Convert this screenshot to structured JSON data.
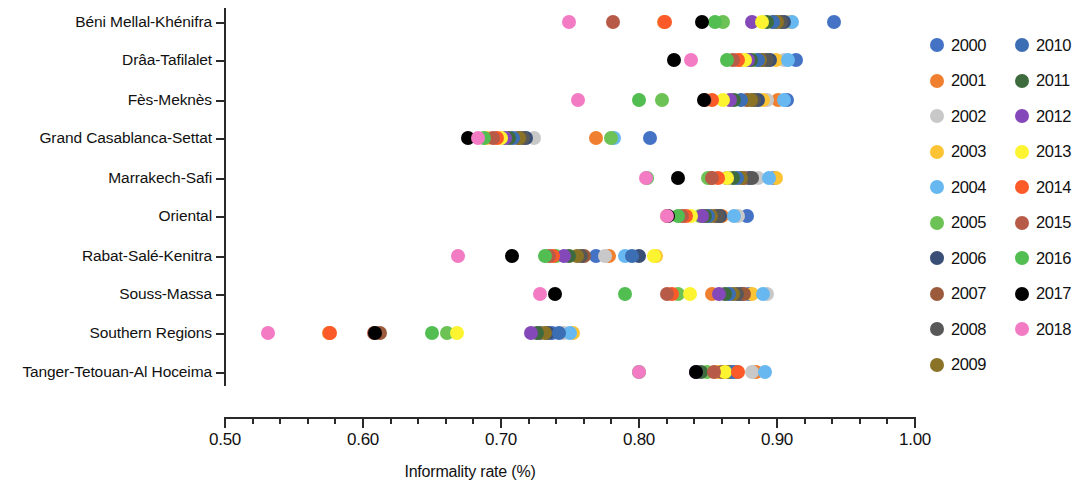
{
  "chart_data": {
    "type": "scatter",
    "title": "",
    "xlabel": "Informality rate (%)",
    "ylabel": "",
    "xlim": [
      0.5,
      1.0
    ],
    "xticks": [
      0.5,
      0.6,
      0.7,
      0.8,
      0.9,
      1.0
    ],
    "xtick_labels": [
      "0.50",
      "0.60",
      "0.70",
      "0.80",
      "0.90",
      "1.00"
    ],
    "xminor_step": 0.02,
    "grid": false,
    "legend_position": "right",
    "categories": [
      "Béni Mellal-Khénifra",
      "Drâa-Tafilalet",
      "Fès-Meknès",
      "Grand Casablanca-Settat",
      "Marrakech-Safi",
      "Oriental",
      "Rabat-Salé-Kenitra",
      "Souss-Massa",
      "Southern Regions",
      "Tanger-Tetouan-Al Hoceima"
    ],
    "series": [
      {
        "name": "2000",
        "color": "#4472c4",
        "values": [
          0.941,
          0.914,
          0.907,
          0.808,
          0.898,
          0.878,
          0.769,
          0.88,
          0.737,
          0.871
        ]
      },
      {
        "name": "2001",
        "color": "#f08030",
        "values": [
          0.818,
          0.873,
          0.901,
          0.769,
          0.852,
          0.86,
          0.778,
          0.853,
          0.575,
          0.885
        ]
      },
      {
        "name": "2002",
        "color": "#c8c8c8",
        "values": [
          0.908,
          0.905,
          0.893,
          0.724,
          0.886,
          0.872,
          0.775,
          0.893,
          0.746,
          0.882
        ]
      },
      {
        "name": "2003",
        "color": "#fcc435",
        "values": [
          0.91,
          0.899,
          0.89,
          0.69,
          0.899,
          0.82,
          0.812,
          0.882,
          0.752,
          0.857
        ]
      },
      {
        "name": "2004",
        "color": "#67b8f0",
        "values": [
          0.911,
          0.908,
          0.905,
          0.782,
          0.894,
          0.869,
          0.79,
          0.89,
          0.75,
          0.891
        ]
      },
      {
        "name": "2005",
        "color": "#6cc254",
        "values": [
          0.861,
          0.884,
          0.817,
          0.78,
          0.85,
          0.844,
          0.74,
          0.828,
          0.661,
          0.849
        ]
      },
      {
        "name": "2006",
        "color": "#3a4f76",
        "values": [
          0.905,
          0.895,
          0.886,
          0.718,
          0.88,
          0.859,
          0.8,
          0.874,
          0.734,
          0.862
        ]
      },
      {
        "name": "2007",
        "color": "#9c5a3c",
        "values": [
          0.898,
          0.89,
          0.878,
          0.712,
          0.876,
          0.855,
          0.76,
          0.876,
          0.612,
          0.86
        ]
      },
      {
        "name": "2008",
        "color": "#585858",
        "values": [
          0.903,
          0.893,
          0.883,
          0.716,
          0.882,
          0.857,
          0.758,
          0.871,
          0.728,
          0.864
        ]
      },
      {
        "name": "2009",
        "color": "#8a7326",
        "values": [
          0.9,
          0.888,
          0.881,
          0.713,
          0.874,
          0.852,
          0.755,
          0.868,
          0.732,
          0.866
        ]
      },
      {
        "name": "2010",
        "color": "#3c6eb4",
        "values": [
          0.897,
          0.886,
          0.874,
          0.709,
          0.871,
          0.85,
          0.795,
          0.865,
          0.742,
          0.868
        ]
      },
      {
        "name": "2011",
        "color": "#3e6b3e",
        "values": [
          0.893,
          0.881,
          0.869,
          0.706,
          0.868,
          0.848,
          0.749,
          0.862,
          0.726,
          0.845
        ]
      },
      {
        "name": "2012",
        "color": "#8448b8",
        "values": [
          0.882,
          0.879,
          0.866,
          0.703,
          0.864,
          0.846,
          0.746,
          0.858,
          0.722,
          0.841
        ]
      },
      {
        "name": "2013",
        "color": "#fcf430",
        "values": [
          0.889,
          0.877,
          0.861,
          0.7,
          0.864,
          0.838,
          0.811,
          0.837,
          0.668,
          0.862
        ]
      },
      {
        "name": "2014",
        "color": "#fc5a28",
        "values": [
          0.819,
          0.872,
          0.853,
          0.697,
          0.857,
          0.834,
          0.738,
          0.824,
          0.576,
          0.872
        ]
      },
      {
        "name": "2015",
        "color": "#b85a48",
        "values": [
          0.781,
          0.868,
          0.848,
          0.694,
          0.853,
          0.831,
          0.735,
          0.82,
          0.608,
          0.854
        ]
      },
      {
        "name": "2016",
        "color": "#52be52",
        "values": [
          0.855,
          0.864,
          0.8,
          0.688,
          0.806,
          0.828,
          0.732,
          0.79,
          0.65,
          0.8
        ]
      },
      {
        "name": "2017",
        "color": "#000000",
        "values": [
          0.846,
          0.825,
          0.847,
          0.676,
          0.828,
          0.821,
          0.708,
          0.739,
          0.609,
          0.841
        ]
      },
      {
        "name": "2018",
        "color": "#f27bc4",
        "values": [
          0.749,
          0.838,
          0.756,
          0.683,
          0.805,
          0.82,
          0.669,
          0.728,
          0.531,
          0.8
        ]
      }
    ]
  },
  "legend": {
    "columns": 2,
    "items": [
      {
        "label": "2000",
        "color": "#4472c4"
      },
      {
        "label": "2001",
        "color": "#f08030"
      },
      {
        "label": "2002",
        "color": "#c8c8c8"
      },
      {
        "label": "2003",
        "color": "#fcc435"
      },
      {
        "label": "2004",
        "color": "#67b8f0"
      },
      {
        "label": "2005",
        "color": "#6cc254"
      },
      {
        "label": "2006",
        "color": "#3a4f76"
      },
      {
        "label": "2007",
        "color": "#9c5a3c"
      },
      {
        "label": "2008",
        "color": "#585858"
      },
      {
        "label": "2009",
        "color": "#8a7326"
      },
      {
        "label": "2010",
        "color": "#3c6eb4"
      },
      {
        "label": "2011",
        "color": "#3e6b3e"
      },
      {
        "label": "2012",
        "color": "#8448b8"
      },
      {
        "label": "2013",
        "color": "#fcf430"
      },
      {
        "label": "2014",
        "color": "#fc5a28"
      },
      {
        "label": "2015",
        "color": "#b85a48"
      },
      {
        "label": "2016",
        "color": "#52be52"
      },
      {
        "label": "2017",
        "color": "#000000"
      },
      {
        "label": "2018",
        "color": "#f27bc4"
      }
    ]
  }
}
